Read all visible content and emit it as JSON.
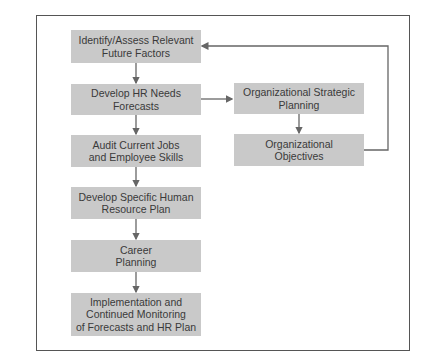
{
  "diagram": {
    "type": "flowchart",
    "colors": {
      "box_fill": "#c9c9c9",
      "text": "#3a3a3a",
      "line": "#666666",
      "frame": "#555555"
    },
    "main_flow": [
      {
        "id": "b1",
        "label": "Identify/Assess Relevant\nFuture Factors"
      },
      {
        "id": "b2",
        "label": "Develop HR Needs\nForecasts"
      },
      {
        "id": "b3",
        "label": "Audit Current Jobs\nand Employee Skills"
      },
      {
        "id": "b4",
        "label": "Develop Specific Human\nResource Plan"
      },
      {
        "id": "b5",
        "label": "Career\nPlanning"
      },
      {
        "id": "b6",
        "label": "Implementation and\nContinued Monitoring\nof Forecasts and HR Plan"
      }
    ],
    "side_flow": [
      {
        "id": "s1",
        "label": "Organizational Strategic\nPlanning"
      },
      {
        "id": "s2",
        "label": "Organizational\nObjectives"
      }
    ],
    "edges": [
      {
        "from": "b1",
        "to": "b2"
      },
      {
        "from": "b2",
        "to": "b3"
      },
      {
        "from": "b3",
        "to": "b4"
      },
      {
        "from": "b4",
        "to": "b5"
      },
      {
        "from": "b5",
        "to": "b6"
      },
      {
        "from": "b2",
        "to": "s1"
      },
      {
        "from": "s1",
        "to": "s2"
      },
      {
        "from": "s2",
        "to": "b1",
        "note": "feedback loop"
      }
    ]
  }
}
